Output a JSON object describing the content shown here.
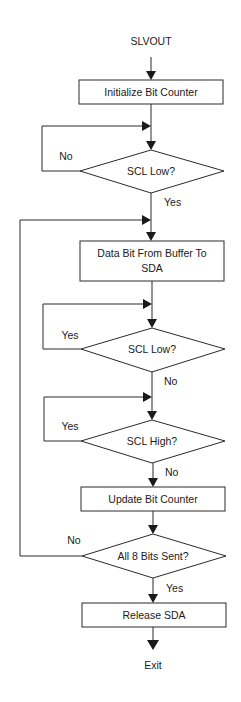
{
  "diagram": {
    "type": "flowchart",
    "start_label": "SLVOUT",
    "end_label": "Exit",
    "nodes": {
      "init": {
        "kind": "process",
        "label": "Initialize Bit Counter"
      },
      "scl_low_1": {
        "kind": "decision",
        "label": "SCL Low?",
        "branch_loop": "No",
        "branch_next": "Yes"
      },
      "data_bit": {
        "kind": "process",
        "label_line1": "Data Bit From Buffer To",
        "label_line2": "SDA"
      },
      "scl_low_2": {
        "kind": "decision",
        "label": "SCL Low?",
        "branch_loop": "Yes",
        "branch_next": "No"
      },
      "scl_high": {
        "kind": "decision",
        "label": "SCL High?",
        "branch_loop": "Yes",
        "branch_next": "No"
      },
      "update": {
        "kind": "process",
        "label": "Update Bit Counter"
      },
      "all_sent": {
        "kind": "decision",
        "label": "All 8 Bits Sent?",
        "branch_loop": "No",
        "branch_next": "Yes"
      },
      "release": {
        "kind": "process",
        "label": "Release SDA"
      }
    },
    "colors": {
      "line": "#2a2a2a",
      "background": "#ffffff",
      "text": "#1a1a1a"
    }
  }
}
